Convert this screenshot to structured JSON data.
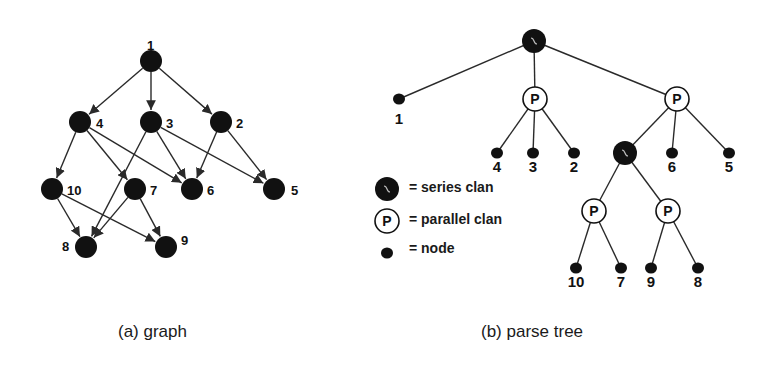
{
  "colors": {
    "ink": "#111111",
    "paper": "#ffffff",
    "edge": "#2a2a2a"
  },
  "graph": {
    "caption": "(a) graph",
    "caption_pos": [
      118,
      322
    ],
    "node_radius": 11,
    "nodes": [
      {
        "id": "1",
        "x": 151,
        "y": 61,
        "lx": 147,
        "ly": 45
      },
      {
        "id": "4",
        "x": 80,
        "y": 122,
        "lx": 96,
        "ly": 123
      },
      {
        "id": "3",
        "x": 151,
        "y": 122,
        "lx": 166,
        "ly": 123
      },
      {
        "id": "2",
        "x": 221,
        "y": 122,
        "lx": 236,
        "ly": 123
      },
      {
        "id": "10",
        "x": 52,
        "y": 189,
        "lx": 67,
        "ly": 190
      },
      {
        "id": "7",
        "x": 135,
        "y": 189,
        "lx": 150,
        "ly": 190
      },
      {
        "id": "6",
        "x": 192,
        "y": 189,
        "lx": 207,
        "ly": 190
      },
      {
        "id": "5",
        "x": 274,
        "y": 189,
        "lx": 291,
        "ly": 190
      },
      {
        "id": "8",
        "x": 86,
        "y": 247,
        "lx": 62,
        "ly": 246
      },
      {
        "id": "9",
        "x": 166,
        "y": 247,
        "lx": 181,
        "ly": 240
      }
    ],
    "edges": [
      [
        "1",
        "4"
      ],
      [
        "1",
        "3"
      ],
      [
        "1",
        "2"
      ],
      [
        "4",
        "10"
      ],
      [
        "4",
        "7"
      ],
      [
        "4",
        "6"
      ],
      [
        "3",
        "8"
      ],
      [
        "3",
        "6"
      ],
      [
        "3",
        "5"
      ],
      [
        "2",
        "6"
      ],
      [
        "2",
        "5"
      ],
      [
        "10",
        "8"
      ],
      [
        "10",
        "9"
      ],
      [
        "7",
        "8"
      ],
      [
        "7",
        "9"
      ]
    ]
  },
  "tree": {
    "caption": "(b) parse tree",
    "caption_pos": [
      481,
      322
    ],
    "nodes": [
      {
        "id": "S1",
        "type": "series",
        "x": 534,
        "y": 41
      },
      {
        "id": "1",
        "type": "node",
        "x": 399,
        "y": 99,
        "label": "1",
        "lx": 399,
        "ly": 124
      },
      {
        "id": "P1",
        "type": "parallel",
        "x": 535,
        "y": 99
      },
      {
        "id": "P2",
        "type": "parallel",
        "x": 677,
        "y": 99
      },
      {
        "id": "4",
        "type": "node",
        "x": 497,
        "y": 153,
        "label": "4",
        "lx": 497,
        "ly": 172
      },
      {
        "id": "3",
        "type": "node",
        "x": 533,
        "y": 153,
        "label": "3",
        "lx": 533,
        "ly": 172
      },
      {
        "id": "2",
        "type": "node",
        "x": 574,
        "y": 153,
        "label": "2",
        "lx": 574,
        "ly": 172
      },
      {
        "id": "S2",
        "type": "series",
        "x": 625,
        "y": 153
      },
      {
        "id": "6",
        "type": "node",
        "x": 672,
        "y": 153,
        "label": "6",
        "lx": 672,
        "ly": 172
      },
      {
        "id": "5",
        "type": "node",
        "x": 729,
        "y": 153,
        "label": "5",
        "lx": 729,
        "ly": 172
      },
      {
        "id": "P3",
        "type": "parallel",
        "x": 594,
        "y": 211
      },
      {
        "id": "P4",
        "type": "parallel",
        "x": 668,
        "y": 211
      },
      {
        "id": "10",
        "type": "node",
        "x": 576,
        "y": 268,
        "label": "10",
        "lx": 576,
        "ly": 287
      },
      {
        "id": "7",
        "type": "node",
        "x": 621,
        "y": 268,
        "label": "7",
        "lx": 621,
        "ly": 287
      },
      {
        "id": "9",
        "type": "node",
        "x": 651,
        "y": 268,
        "label": "9",
        "lx": 651,
        "ly": 287
      },
      {
        "id": "8",
        "type": "node",
        "x": 698,
        "y": 268,
        "label": "8",
        "lx": 698,
        "ly": 287
      }
    ],
    "edges": [
      [
        "S1",
        "1"
      ],
      [
        "S1",
        "P1"
      ],
      [
        "S1",
        "P2"
      ],
      [
        "P1",
        "4"
      ],
      [
        "P1",
        "3"
      ],
      [
        "P1",
        "2"
      ],
      [
        "P2",
        "S2"
      ],
      [
        "P2",
        "6"
      ],
      [
        "P2",
        "5"
      ],
      [
        "S2",
        "P3"
      ],
      [
        "S2",
        "P4"
      ],
      [
        "P3",
        "10"
      ],
      [
        "P3",
        "7"
      ],
      [
        "P4",
        "9"
      ],
      [
        "P4",
        "8"
      ]
    ],
    "parallel_glyph": "P",
    "legend": [
      {
        "type": "series",
        "x": 387,
        "y": 189,
        "text": "= series clan",
        "tx": 409,
        "ty": 179
      },
      {
        "type": "parallel",
        "x": 387,
        "y": 221,
        "text": "= parallel clan",
        "tx": 409,
        "ty": 211
      },
      {
        "type": "node",
        "x": 387,
        "y": 253,
        "text": "= node",
        "tx": 409,
        "ty": 240
      }
    ]
  }
}
